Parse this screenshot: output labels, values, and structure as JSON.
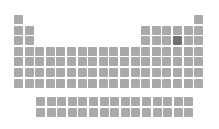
{
  "figure": {
    "type": "periodic-table-locator",
    "highlighted_element": {
      "symbol": "S",
      "name": "Sulfur",
      "period": 3,
      "group": 16
    },
    "colors": {
      "cell": "#a9a9a9",
      "highlight": "#707070",
      "background": "#ffffff"
    }
  },
  "layout": {
    "origin_x": 14,
    "origin_y": 15,
    "pitch_x": 10.6,
    "pitch_y": 10.6,
    "fblock_origin_x": 36,
    "fblock_origin_y": 97,
    "cell_size": 9
  },
  "grid": {
    "rows": [
      {
        "period": 1,
        "groups": [
          1,
          18
        ]
      },
      {
        "period": 2,
        "groups": [
          1,
          2,
          13,
          14,
          15,
          16,
          17,
          18
        ]
      },
      {
        "period": 3,
        "groups": [
          1,
          2,
          13,
          14,
          15,
          16,
          17,
          18
        ]
      },
      {
        "period": 4,
        "groups": [
          1,
          2,
          3,
          4,
          5,
          6,
          7,
          8,
          9,
          10,
          11,
          12,
          13,
          14,
          15,
          16,
          17,
          18
        ]
      },
      {
        "period": 5,
        "groups": [
          1,
          2,
          3,
          4,
          5,
          6,
          7,
          8,
          9,
          10,
          11,
          12,
          13,
          14,
          15,
          16,
          17,
          18
        ]
      },
      {
        "period": 6,
        "groups": [
          1,
          2,
          3,
          4,
          5,
          6,
          7,
          8,
          9,
          10,
          11,
          12,
          13,
          14,
          15,
          16,
          17,
          18
        ]
      },
      {
        "period": 7,
        "groups": [
          1,
          2,
          3,
          4,
          5,
          6,
          7,
          8,
          9,
          10,
          11,
          12,
          13,
          14,
          15,
          16,
          17,
          18
        ]
      }
    ],
    "fblock": [
      {
        "series": "lanthanides",
        "count": 15
      },
      {
        "series": "actinides",
        "count": 15
      }
    ]
  }
}
